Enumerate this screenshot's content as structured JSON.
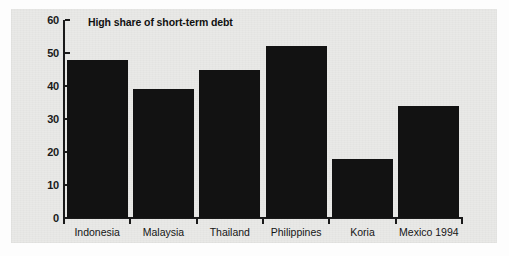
{
  "chart_data": {
    "type": "bar",
    "title": "High share of short-term debt",
    "xlabel": "",
    "ylabel": "",
    "categories": [
      "Indonesia",
      "Malaysia",
      "Thailand",
      "Philippines",
      "Koria",
      "Mexico 1994"
    ],
    "values": [
      48,
      39,
      45,
      52,
      18,
      34
    ],
    "ylim": [
      0,
      60
    ],
    "yticks": [
      0,
      10,
      20,
      30,
      40,
      50,
      60
    ],
    "ytick_labels": [
      "0",
      "10",
      "20",
      "30",
      "40",
      "50",
      "60"
    ],
    "grid": false,
    "legend": false,
    "legend_position": "none",
    "bar_color": "#121212",
    "background_color": "#e9e9e7",
    "axis_color": "#1a1a1a",
    "text_color": "#111111"
  },
  "figure": {
    "title_text": "High share of short-term debt"
  }
}
